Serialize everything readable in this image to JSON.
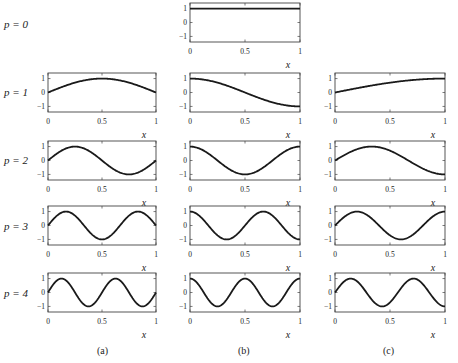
{
  "chart_data": {
    "type": "line",
    "title": "",
    "layout": {
      "rows": [
        "p = 0",
        "p = 1",
        "p = 2",
        "p = 3",
        "p = 4"
      ],
      "columns": [
        "(a)",
        "(b)",
        "(c)"
      ],
      "grid": false,
      "legend": "none"
    },
    "xlabel": "x",
    "xlim": [
      0,
      1
    ],
    "ylim": [
      -1.4,
      1.4
    ],
    "xticks": [
      "0",
      "0.5",
      "1"
    ],
    "yticks": [
      "1",
      "0",
      "−1"
    ],
    "panels": [
      {
        "row": 0,
        "col": 1,
        "row_label": "p = 0",
        "column": "(b)",
        "function": "cos(0·πx)",
        "kind": "cos",
        "k": 0,
        "x": [
          0,
          0.25,
          0.5,
          0.75,
          1
        ],
        "y": [
          1,
          1,
          1,
          1,
          1
        ]
      },
      {
        "row": 1,
        "col": 0,
        "row_label": "p = 1",
        "column": "(a)",
        "function": "sin(πx)",
        "kind": "sin",
        "k": 1,
        "x": [
          0,
          0.25,
          0.5,
          0.75,
          1
        ],
        "y": [
          0,
          0.71,
          1,
          0.71,
          0
        ]
      },
      {
        "row": 1,
        "col": 1,
        "row_label": "p = 1",
        "column": "(b)",
        "function": "cos(πx)",
        "kind": "cos",
        "k": 1,
        "x": [
          0,
          0.25,
          0.5,
          0.75,
          1
        ],
        "y": [
          1,
          0.71,
          0,
          -0.71,
          -1
        ]
      },
      {
        "row": 1,
        "col": 2,
        "row_label": "p = 1",
        "column": "(c)",
        "function": "sin(πx/2)",
        "kind": "sin",
        "k": 0.5,
        "x": [
          0,
          0.25,
          0.5,
          0.75,
          1
        ],
        "y": [
          0,
          0.38,
          0.71,
          0.92,
          1
        ]
      },
      {
        "row": 2,
        "col": 0,
        "row_label": "p = 2",
        "column": "(a)",
        "function": "sin(2πx)",
        "kind": "sin",
        "k": 2,
        "x": [
          0,
          0.25,
          0.5,
          0.75,
          1
        ],
        "y": [
          0,
          1,
          0,
          -1,
          0
        ]
      },
      {
        "row": 2,
        "col": 1,
        "row_label": "p = 2",
        "column": "(b)",
        "function": "cos(2πx)",
        "kind": "cos",
        "k": 2,
        "x": [
          0,
          0.25,
          0.5,
          0.75,
          1
        ],
        "y": [
          1,
          0,
          -1,
          0,
          1
        ]
      },
      {
        "row": 2,
        "col": 2,
        "row_label": "p = 2",
        "column": "(c)",
        "function": "sin(3πx/2)",
        "kind": "sin",
        "k": 1.5,
        "x": [
          0,
          0.25,
          0.5,
          0.75,
          1
        ],
        "y": [
          0,
          0.92,
          0.71,
          -0.38,
          -1
        ]
      },
      {
        "row": 3,
        "col": 0,
        "row_label": "p = 3",
        "column": "(a)",
        "function": "sin(3πx)",
        "kind": "sin",
        "k": 3,
        "x": [
          0,
          0.25,
          0.5,
          0.75,
          1
        ],
        "y": [
          0,
          0.71,
          -1,
          0.71,
          0
        ]
      },
      {
        "row": 3,
        "col": 1,
        "row_label": "p = 3",
        "column": "(b)",
        "function": "cos(3πx)",
        "kind": "cos",
        "k": 3,
        "x": [
          0,
          0.25,
          0.5,
          0.75,
          1
        ],
        "y": [
          1,
          -0.71,
          0,
          0.71,
          -1
        ]
      },
      {
        "row": 3,
        "col": 2,
        "row_label": "p = 3",
        "column": "(c)",
        "function": "sin(5πx/2)",
        "kind": "sin",
        "k": 2.5,
        "x": [
          0,
          0.25,
          0.5,
          0.75,
          1
        ],
        "y": [
          0,
          0.92,
          -0.71,
          -0.38,
          1
        ]
      },
      {
        "row": 4,
        "col": 0,
        "row_label": "p = 4",
        "column": "(a)",
        "function": "sin(4πx)",
        "kind": "sin",
        "k": 4,
        "x": [
          0,
          0.25,
          0.5,
          0.75,
          1
        ],
        "y": [
          0,
          0,
          0,
          0,
          0
        ]
      },
      {
        "row": 4,
        "col": 1,
        "row_label": "p = 4",
        "column": "(b)",
        "function": "cos(4πx)",
        "kind": "cos",
        "k": 4,
        "x": [
          0,
          0.25,
          0.5,
          0.75,
          1
        ],
        "y": [
          1,
          1,
          1,
          1,
          1
        ]
      },
      {
        "row": 4,
        "col": 2,
        "row_label": "p = 4",
        "column": "(c)",
        "function": "sin(7πx/2)",
        "kind": "sin",
        "k": 3.5,
        "x": [
          0,
          0.25,
          0.5,
          0.75,
          1
        ],
        "y": [
          0,
          0.38,
          -0.71,
          0.92,
          -1
        ]
      }
    ]
  },
  "figure": {
    "row_labels": [
      "p = 0",
      "p = 1",
      "p = 2",
      "p = 3",
      "p = 4"
    ],
    "column_captions": [
      "(a)",
      "(b)",
      "(c)"
    ],
    "x_axis_label": "x",
    "x_tick_labels": [
      "0",
      "0.5",
      "1"
    ],
    "y_tick_labels": [
      "1",
      "0",
      "−1"
    ],
    "line_color": "#1a1a1a",
    "frame_color": "#444444"
  }
}
